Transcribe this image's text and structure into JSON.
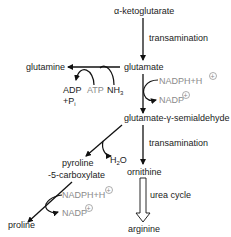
{
  "diagram": {
    "type": "metabolic-pathway",
    "nodes": {
      "akg": "α-ketoglutarate",
      "glutamate": "glutamate",
      "glutamine": "glutamine",
      "g5sa": "glutamate-γ-semialdehyde",
      "p5c_1": "pyroline",
      "p5c_2": "-5-carboxylate",
      "ornithine": "ornithine",
      "arginine": "arginine",
      "proline": "proline"
    },
    "edge_labels": {
      "transamination_1": "transamination",
      "transamination_2": "transamination",
      "urea_cycle": "urea cycle"
    },
    "cofactors": {
      "adp": "ADP",
      "pi_prefix": "+P",
      "pi_sub": "i",
      "atp": "ATP",
      "nh3": "NH",
      "nh3_sub": "3",
      "nadph_1": "NADPH+H",
      "nadp_1": "NADP",
      "h2o_h": "H",
      "h2o_sub": "2",
      "h2o_o": "O",
      "nadph_2": "NADPH+H",
      "nadp_2": "NADP",
      "plus_sign": "+"
    },
    "colors": {
      "text": "#222222",
      "cofactor_grey": "#8a8a8a",
      "arrow": "#111111"
    }
  }
}
